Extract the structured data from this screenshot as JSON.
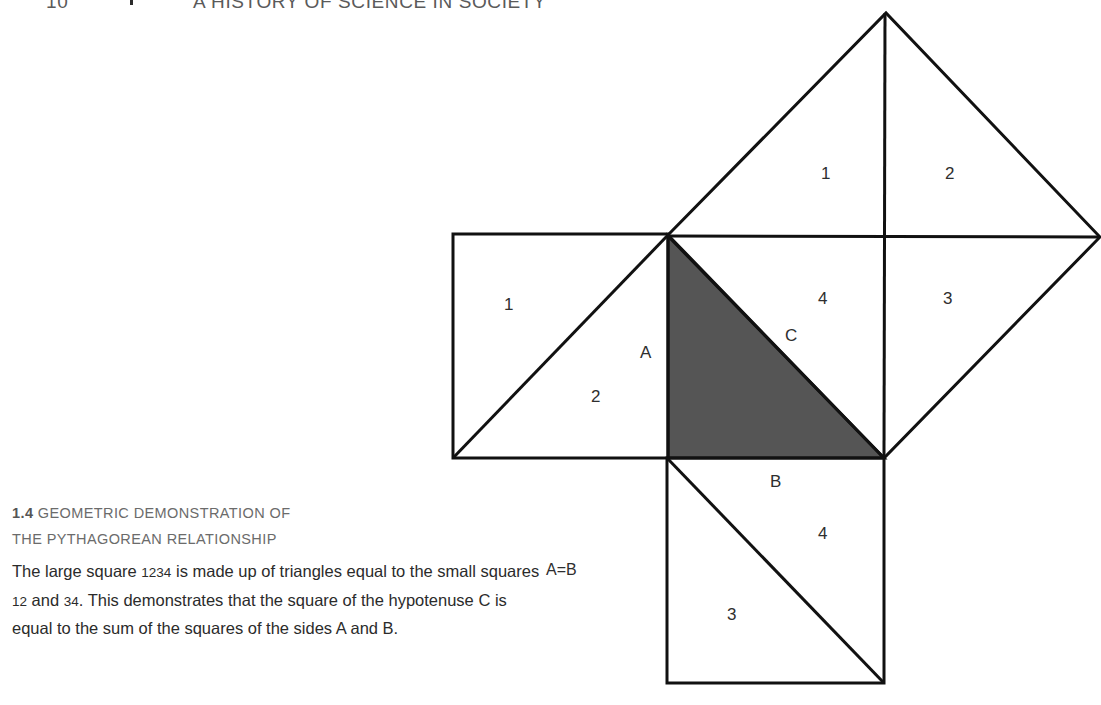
{
  "running_head": {
    "page_number": "10",
    "book_title": "A HISTORY OF SCIENCE IN SOCIETY"
  },
  "figure": {
    "number": "1.4",
    "title_line1": "GEOMETRIC DEMONSTRATION OF",
    "title_line2": "THE PYTHAGOREAN RELATIONSHIP",
    "body_parts": [
      "The large square ",
      "1234",
      " is made up of triangles equal to the small squares ",
      "12",
      " and ",
      "34",
      ". This demonstrates that the square of the hypotenuse C is equal to the sum of the squares of the sides A and B."
    ],
    "annotation": "A=B",
    "colors": {
      "line": "#111111",
      "shaded_triangle": "#555555",
      "text": "#2b2b2b",
      "caption_title": "#6b6b6b"
    }
  },
  "diagram": {
    "left_square": {
      "label_1": "1",
      "label_2": "2",
      "side_label": "A"
    },
    "large_square": {
      "label_1": "1",
      "label_2": "2",
      "label_3": "3",
      "label_4": "4",
      "side_label": "C"
    },
    "bottom_square": {
      "label_3": "3",
      "label_4": "4",
      "side_label": "B"
    }
  }
}
